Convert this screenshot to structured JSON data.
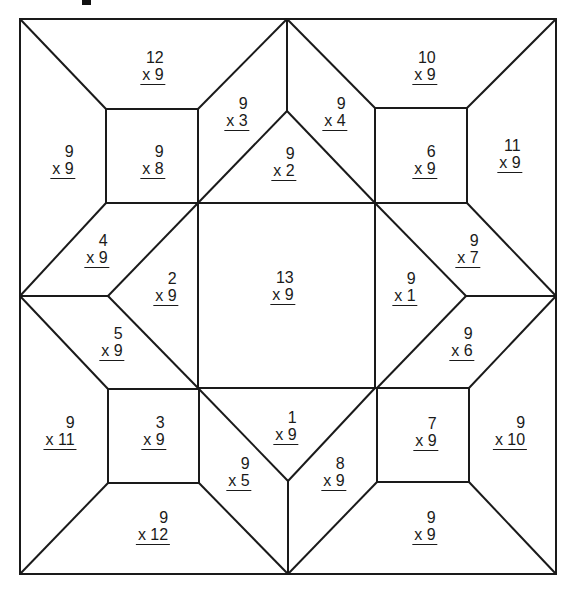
{
  "worksheet": {
    "title": "Multiplication by 9 quilt coloring worksheet",
    "line_color": "#1a1a1a",
    "background": "#ffffff",
    "problems": [
      {
        "id": "top-left-trapezoid",
        "top": "12",
        "bottom": "x 9",
        "x": 153,
        "y": 67
      },
      {
        "id": "top-left-left-trapezoid",
        "top": "9",
        "bottom": "x 9",
        "x": 63,
        "y": 161
      },
      {
        "id": "top-left-square",
        "top": "9",
        "bottom": "x 8",
        "x": 153,
        "y": 161
      },
      {
        "id": "top-left-diamond-upper",
        "top": "9",
        "bottom": "x 3",
        "x": 237,
        "y": 113
      },
      {
        "id": "top-center-triangle",
        "top": "9",
        "bottom": "x 2",
        "x": 284,
        "y": 163
      },
      {
        "id": "top-right-diamond-upper",
        "top": "9",
        "bottom": "x 4",
        "x": 335,
        "y": 113
      },
      {
        "id": "top-right-trapezoid",
        "top": "10",
        "bottom": "x 9",
        "x": 425,
        "y": 67
      },
      {
        "id": "top-right-square",
        "top": "6",
        "bottom": "x 9",
        "x": 425,
        "y": 161
      },
      {
        "id": "top-right-right-trapezoid",
        "top": "11",
        "bottom": "x 9",
        "x": 510,
        "y": 155
      },
      {
        "id": "left-upper-parallelogram",
        "top": "4",
        "bottom": "x 9",
        "x": 97,
        "y": 250
      },
      {
        "id": "left-center-triangle",
        "top": "2",
        "bottom": "x 9",
        "x": 166,
        "y": 288
      },
      {
        "id": "center-square",
        "top": "13",
        "bottom": "x 9",
        "x": 283,
        "y": 287
      },
      {
        "id": "right-center-triangle",
        "top": "9",
        "bottom": "x 1",
        "x": 405,
        "y": 288
      },
      {
        "id": "right-upper-parallelogram",
        "top": "9",
        "bottom": "x 7",
        "x": 468,
        "y": 250
      },
      {
        "id": "left-lower-parallelogram",
        "top": "5",
        "bottom": "x 9",
        "x": 112,
        "y": 343
      },
      {
        "id": "right-lower-parallelogram",
        "top": "9",
        "bottom": "x 6",
        "x": 462,
        "y": 343
      },
      {
        "id": "bottom-left-left-trapezoid",
        "top": "9",
        "bottom": "x 11",
        "x": 60,
        "y": 432
      },
      {
        "id": "bottom-left-square",
        "top": "3",
        "bottom": "x 9",
        "x": 154,
        "y": 432
      },
      {
        "id": "bottom-center-triangle",
        "top": "1",
        "bottom": "x 9",
        "x": 286,
        "y": 427
      },
      {
        "id": "bottom-left-diamond-lower",
        "top": "9",
        "bottom": "x 5",
        "x": 239,
        "y": 473
      },
      {
        "id": "bottom-right-diamond-lower",
        "top": "8",
        "bottom": "x 9",
        "x": 334,
        "y": 473
      },
      {
        "id": "bottom-right-square",
        "top": "7",
        "bottom": "x 9",
        "x": 426,
        "y": 433
      },
      {
        "id": "bottom-right-right-trapezoid",
        "top": "9",
        "bottom": "x 10",
        "x": 510,
        "y": 432
      },
      {
        "id": "bottom-left-trapezoid",
        "top": "9",
        "bottom": "x 12",
        "x": 153,
        "y": 527
      },
      {
        "id": "bottom-right-trapezoid",
        "top": "9",
        "bottom": "x 9",
        "x": 425,
        "y": 527
      }
    ]
  }
}
